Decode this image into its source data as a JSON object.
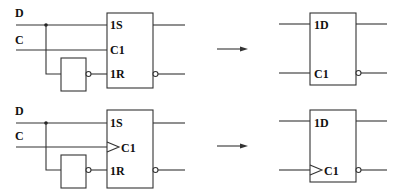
{
  "diagram": {
    "type": "logic-circuit-equivalence",
    "colors": {
      "line": "#333333",
      "text": "#111111",
      "background": "#ffffff"
    },
    "rows": [
      {
        "name": "level-triggered",
        "inputs": {
          "d": "D",
          "c": "C"
        },
        "sr_latch": {
          "pins": {
            "s": "1S",
            "c": "C1",
            "r": "1R"
          },
          "clock_edge": false
        },
        "equivalent": {
          "pins": {
            "d": "1D",
            "c": "C1"
          },
          "clock_edge": false
        }
      },
      {
        "name": "edge-triggered",
        "inputs": {
          "d": "D",
          "c": "C"
        },
        "sr_latch": {
          "pins": {
            "s": "1S",
            "c": "C1",
            "r": "1R"
          },
          "clock_edge": true
        },
        "equivalent": {
          "pins": {
            "d": "1D",
            "c": "C1"
          },
          "clock_edge": true
        }
      }
    ],
    "arrow": "equivalent-to"
  }
}
